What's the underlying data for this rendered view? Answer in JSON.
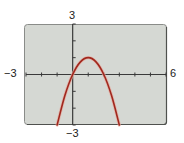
{
  "chart_data": {
    "type": "line",
    "title": "",
    "xlabel": "",
    "ylabel": "",
    "xlim": [
      -3,
      6
    ],
    "ylim": [
      -3,
      3
    ],
    "xscale_ticks": 1,
    "yscale_ticks": 1,
    "grid": false,
    "tick_labels": {
      "xmin": "−3",
      "xmax": "6",
      "ymax": "3",
      "ymin": "−3"
    },
    "series": [
      {
        "name": "y = -x^2 + 2x",
        "color": "#a0281e",
        "x": [
          -1,
          -0.5,
          0,
          0.5,
          1,
          1.5,
          2,
          2.5,
          3
        ],
        "y": [
          -3,
          -1.25,
          0,
          0.75,
          1,
          0.75,
          0,
          -1.25,
          -3
        ]
      }
    ]
  },
  "colors": {
    "plot_bg": "#d5d8d3",
    "border": "#6f716e",
    "axis": "#3a3a3a",
    "curve": "#a0281e",
    "curve_glow": "#e8a99c"
  }
}
